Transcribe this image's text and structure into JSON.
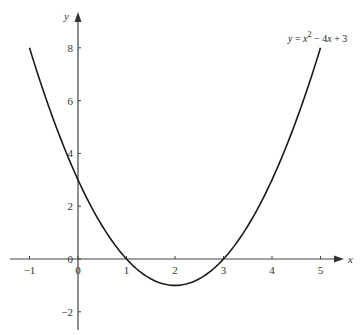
{
  "chart_data": {
    "type": "line",
    "title": "",
    "xlabel": "x",
    "ylabel": "y",
    "xlim": [
      -1.3,
      5.5
    ],
    "ylim": [
      -2.6,
      9.2
    ],
    "grid": false,
    "x_ticks": [
      "-1",
      "0",
      "1",
      "2",
      "3",
      "4",
      "5"
    ],
    "y_ticks": [
      "-2",
      "0",
      "2",
      "4",
      "6",
      "8"
    ],
    "annotation": "y = x^2 - 4x + 3",
    "series": [
      {
        "name": "y = x^2 - 4x + 3",
        "x": [
          -1,
          -0.5,
          0,
          0.5,
          1,
          1.5,
          2,
          2.5,
          3,
          3.5,
          4,
          4.5,
          5
        ],
        "y": [
          8,
          5.25,
          3,
          1.25,
          0,
          -0.75,
          -1,
          -0.75,
          0,
          1.25,
          3,
          5.25,
          8
        ]
      }
    ],
    "color": "#1a1a1a",
    "axis_color": "#444444"
  },
  "labels": {
    "x_axis": "x",
    "y_axis": "y",
    "eq_y": "y",
    "eq_eq": " = ",
    "eq_x": "x",
    "eq_sup": "2",
    "eq_rest1": " − 4",
    "eq_x2": "x",
    "eq_rest2": " + 3",
    "ticks_x": [
      "−1",
      "0",
      "1",
      "2",
      "3",
      "4",
      "5"
    ],
    "ticks_y": [
      "−2",
      "0",
      "2",
      "4",
      "6",
      "8"
    ]
  }
}
